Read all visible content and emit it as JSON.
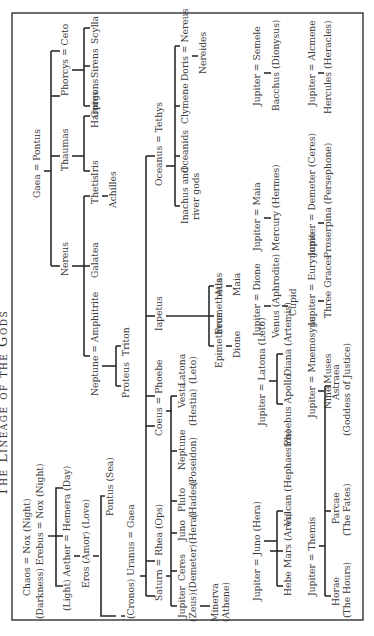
{
  "title": "The Lineage of the Gods",
  "nodes": {
    "chaos": "Chaos = Nox (Night)",
    "erebus": "(Darkness) Erebus = Nox (Night)",
    "aether": "(Light) Aether = Hemera (Day)",
    "eros": "Eros (Amor) (Love)",
    "pontus_sea": "Pontus (Sea)",
    "uranus": "(Cronos) Uranus = Gaea",
    "saturn": "Saturn = Rhea (Ops)",
    "jupiter_zeus": [
      "Jupiter",
      "(Zeus)"
    ],
    "ceres": [
      "Ceres",
      "(Demeter)"
    ],
    "juno": [
      "Juno",
      "(Hera)"
    ],
    "pluto": [
      "Pluto",
      "(Hades)"
    ],
    "neptune_p": [
      "Neptune",
      "(Poseidon)"
    ],
    "vesta": [
      "Vesta",
      "(Hestia)"
    ],
    "minerva": [
      "Minerva",
      "(Athene)"
    ],
    "coeus": "Coeus = Phoebe",
    "latona": [
      "Latona",
      "(Leto)"
    ],
    "iapetus": "Iapetus",
    "epimetheus": "Epimetheus",
    "prometheus": "Prometheus",
    "atlas": "Atlas",
    "dione": "Dione",
    "maia": "Maia",
    "oceanus": "Oceanus = Tethys",
    "inachus": [
      "Inachus and",
      "river gods"
    ],
    "oceanids": "Oceanids",
    "clymene": "Clymene",
    "doris": "Doris = Nereus",
    "nereides": "Nereides",
    "gaea_pontus": "Gaea = Pontus",
    "nereus": "Nereus",
    "neptune_amph": "Neptune = Amphitrite",
    "proteus": "Proteus",
    "triton": "Triton",
    "galatea": "Galatea",
    "thetis": "Thetis",
    "achilles": "Achilles",
    "thaumas": "Thaumas",
    "iris": "Iris",
    "harpies": "Harpies",
    "phorcys": "Phorcys = Ceto",
    "gorgons": "Gorgons",
    "sirens": "Sirens",
    "scylla": "Scylla",
    "jupiter_juno": "Jupiter = Juno (Hera)",
    "hebe": "Hebe",
    "mars": "Mars (Ares)",
    "vulcan": "Vulcan (Hephaestos)",
    "jupiter_themis": "Jupiter = Themis",
    "horae": [
      "Horae",
      "(The Hours)"
    ],
    "parcae": [
      "Parcae",
      "(The Fates)"
    ],
    "astraea": [
      "Astraea",
      "(Goddess of Justice)"
    ],
    "jupiter_latona": "Jupiter = Latona (Leto)",
    "phoebus": "Phoebus Apollo",
    "diana": "Diana (Artemis)",
    "jupiter_mnemosyne": "Jupiter = Mnemosyne",
    "nine_muses": "Nine Muses",
    "jupiter_dione": "Jupiter = Dione",
    "venus": "Venus (Aphrodite)",
    "cupid": "Cupid",
    "jupiter_eurynome": "Jupiter = Eurynome",
    "three_graces": "Three Graces",
    "jupiter_maia": "Jupiter = Maia",
    "mercury": "Mercury (Hermes)",
    "jupiter_demeter": "Jupiter = Demeter (Ceres)",
    "proserpina": "Proserpina (Persephone)",
    "jupiter_semele": "Jupiter = Semele",
    "bacchus": "Bacchus (Dionysus)",
    "jupiter_alcmene": "Jupiter = Alcmene",
    "hercules": "Hercules (Heracles)"
  }
}
